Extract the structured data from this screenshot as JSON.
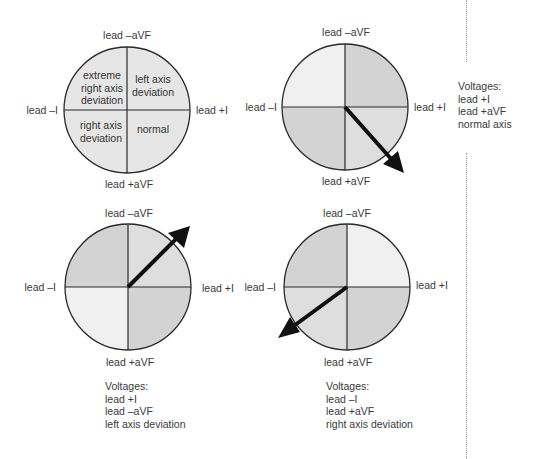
{
  "colors": {
    "stroke": "#2a2a2a",
    "arrow": "#111111",
    "fill_uniform": "#e6e6e6",
    "fill_dark": "#d3d3d3",
    "fill_medium": "#dedede",
    "fill_light": "#f0f0f0"
  },
  "diagrams": [
    {
      "id": "reference",
      "labels": {
        "top": "lead –aVF",
        "bottom": "lead +aVF",
        "left": "lead –I",
        "right": "lead +I"
      },
      "quadrants": {
        "top_left": "extreme\nright axis\ndeviation",
        "top_right": "left axis\ndeviation",
        "bottom_left": "right axis\ndeviation",
        "bottom_right": "normal"
      }
    },
    {
      "id": "normal-axis",
      "labels": {
        "top": "lead –aVF",
        "bottom": "lead +aVF",
        "left": "lead –I",
        "right": "lead +I"
      },
      "arrow_direction": "down-right",
      "voltages": {
        "title": "Voltages:",
        "lines": [
          "lead +I",
          "lead +aVF",
          "normal axis"
        ]
      }
    },
    {
      "id": "left-axis-deviation",
      "labels": {
        "top": "lead –aVF",
        "bottom": "lead +aVF",
        "left": "lead –I",
        "right": "lead +I"
      },
      "arrow_direction": "up-right",
      "voltages": {
        "title": "Voltages:",
        "lines": [
          "lead +I",
          "lead –aVF",
          "left axis deviation"
        ]
      }
    },
    {
      "id": "right-axis-deviation",
      "labels": {
        "top": "lead –aVF",
        "bottom": "lead +aVF",
        "left": "lead –I",
        "right": "lead +I"
      },
      "arrow_direction": "down-left",
      "voltages": {
        "title": "Voltages:",
        "lines": [
          "lead –I",
          "lead +aVF",
          "right axis deviation"
        ]
      }
    }
  ]
}
